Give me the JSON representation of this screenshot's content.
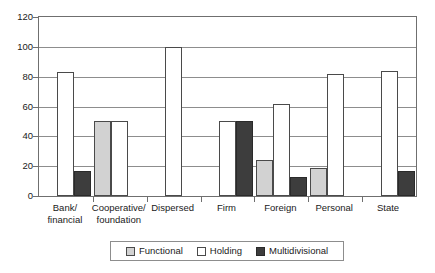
{
  "chart_data": {
    "type": "bar",
    "title": "",
    "subtitle": "",
    "xlabel": "",
    "ylabel": "",
    "ylim": [
      0,
      120
    ],
    "y_ticks": [
      0,
      20,
      40,
      60,
      80,
      100,
      120
    ],
    "grid": true,
    "legend_position": "bottom",
    "categories": [
      "Bank/\nfinancial",
      "Cooperative/\nfoundation",
      "Dispersed",
      "Firm",
      "Foreign",
      "Personal",
      "State"
    ],
    "category_lines": [
      [
        "Bank/",
        "financial"
      ],
      [
        "Cooperative/",
        "foundation"
      ],
      [
        "Dispersed",
        ""
      ],
      [
        "Firm",
        ""
      ],
      [
        "Foreign",
        ""
      ],
      [
        "Personal",
        ""
      ],
      [
        "State",
        ""
      ]
    ],
    "series": [
      {
        "name": "Functional",
        "color": "#d2d2d2",
        "values": [
          0,
          50,
          0,
          0,
          24,
          19,
          0
        ]
      },
      {
        "name": "Holding",
        "color": "#ffffff",
        "values": [
          83,
          50,
          100,
          50,
          62,
          82,
          84
        ]
      },
      {
        "name": "Multidivisional",
        "color": "#3d3d3d",
        "values": [
          17,
          0,
          0,
          50,
          13,
          0,
          17
        ]
      }
    ]
  },
  "legend": {
    "entries": [
      {
        "label": "Functional",
        "swatch": "functional"
      },
      {
        "label": "Holding",
        "swatch": "holding"
      },
      {
        "label": "Multidivisional",
        "swatch": "multidivisional"
      }
    ]
  },
  "axis": {
    "y_tick_labels": [
      "0",
      "20",
      "40",
      "60",
      "80",
      "100",
      "120"
    ]
  },
  "colors": {
    "functional": "#d2d2d2",
    "holding": "#ffffff",
    "multidivisional": "#3d3d3d",
    "frame": "#6f6f6f",
    "gridline": "#8d8d8d",
    "text": "#1a1a1a"
  }
}
